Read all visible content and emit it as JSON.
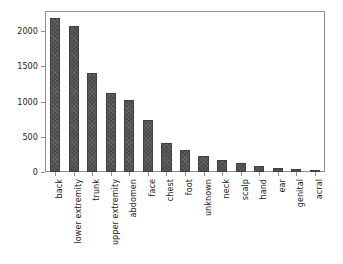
{
  "chart_data": {
    "type": "bar",
    "title": "",
    "xlabel": "",
    "ylabel": "",
    "ylim": [
      0,
      2270
    ],
    "yticks": [
      0,
      500,
      1000,
      1500,
      2000
    ],
    "ytick_labels": [
      "0",
      "500",
      "1000",
      "1500",
      "2000"
    ],
    "grid": false,
    "legend": null,
    "bar_color": "#4a4a4a",
    "categories": [
      "back",
      "lower extremity",
      "trunk",
      "upper extremity",
      "abdomen",
      "face",
      "chest",
      "foot",
      "unknown",
      "neck",
      "scalp",
      "hand",
      "ear",
      "genital",
      "acral"
    ],
    "values": [
      2192,
      2077,
      1404,
      1118,
      1022,
      745,
      407,
      319,
      234,
      168,
      128,
      90,
      57,
      43,
      7
    ]
  }
}
